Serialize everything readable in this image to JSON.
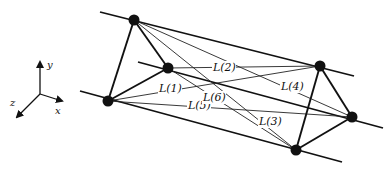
{
  "figure": {
    "axes": {
      "origin": [
        40,
        94
      ],
      "x": {
        "label": "x",
        "end": [
          62,
          101
        ],
        "label_pos": [
          55,
          114
        ]
      },
      "y": {
        "label": "y",
        "end": [
          40,
          62
        ],
        "label_pos": [
          47,
          68
        ]
      },
      "z": {
        "label": "z",
        "end": [
          17,
          117
        ],
        "label_pos": [
          10,
          106
        ]
      }
    },
    "nodes": {
      "A": [
        134,
        20
      ],
      "B": [
        168,
        68
      ],
      "C": [
        108,
        101
      ],
      "D": [
        320,
        66
      ],
      "E": [
        352,
        117
      ],
      "F": [
        296,
        150
      ]
    },
    "parallel_lines": [
      {
        "from": [
          100,
          12
        ],
        "to": [
          354,
          76
        ]
      },
      {
        "from": [
          138,
          62
        ],
        "to": [
          383,
          128
        ]
      },
      {
        "from": [
          80,
          91
        ],
        "to": [
          342,
          162
        ]
      }
    ],
    "triangle_edges": [
      [
        "A",
        "B"
      ],
      [
        "B",
        "C"
      ],
      [
        "C",
        "A"
      ],
      [
        "D",
        "E"
      ],
      [
        "E",
        "F"
      ],
      [
        "F",
        "D"
      ]
    ],
    "connecting_lines": [
      {
        "label": "L(1)",
        "from": "C",
        "to": "D",
        "label_pos": [
          159,
          92
        ]
      },
      {
        "label": "L(2)",
        "from": "B",
        "to": "D",
        "label_pos": [
          213,
          71
        ]
      },
      {
        "label": "L(3)",
        "from": "A",
        "to": "F",
        "label_pos": [
          259,
          125
        ]
      },
      {
        "label": "L(4)",
        "from": "A",
        "to": "E",
        "label_pos": [
          281,
          90
        ]
      },
      {
        "label": "L(5)",
        "from": "C",
        "to": "E",
        "label_pos": [
          188,
          109
        ]
      },
      {
        "label": "L(6)",
        "from": "B",
        "to": "F",
        "label_pos": [
          203,
          101
        ]
      }
    ]
  }
}
